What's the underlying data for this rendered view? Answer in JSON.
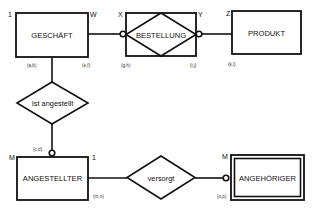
{
  "diagram": {
    "type": "ER diagram",
    "entities": {
      "geschaeft": {
        "label": "GESCHÄFT",
        "kind": "entity"
      },
      "bestellung": {
        "label": "BESTELLUNG",
        "kind": "associative-entity"
      },
      "produkt": {
        "label": "PRODUKT",
        "kind": "entity"
      },
      "angestellter": {
        "label": "ANGESTELLTER",
        "kind": "entity"
      },
      "angehoeriger": {
        "label": "ANGEHÖRIGER",
        "kind": "weak-entity"
      }
    },
    "relationships": {
      "ist_angestellt": {
        "label": "Ist angestellt"
      },
      "versorgt": {
        "label": "versorgt"
      }
    },
    "cardinalities": {
      "geschaeft_left": "1",
      "geschaeft_right": "W",
      "bestellung_left": "X",
      "bestellung_right": "Y",
      "produkt_left": "Z",
      "angestellter_left": "M",
      "angestellter_right": "1",
      "angehoeriger_left": "M"
    },
    "min_max_pairs": {
      "ab": "(a,b)",
      "ef": "(e,f)",
      "gh": "(g,h)",
      "ij": "(i,j)",
      "kl": "(k,l)",
      "cd": "(c,d)",
      "mn": "(m,n)",
      "op": "(o,p)"
    },
    "colors": {
      "stroke": "#111111",
      "background": "#ffffff"
    }
  }
}
